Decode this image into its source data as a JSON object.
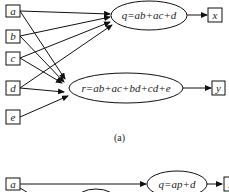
{
  "diagram_a": {
    "inputs": [
      {
        "id": "a",
        "label": "a"
      },
      {
        "id": "b",
        "label": "b"
      },
      {
        "id": "c",
        "label": "c"
      },
      {
        "id": "d",
        "label": "d"
      },
      {
        "id": "e",
        "label": "e"
      }
    ],
    "nodes": [
      {
        "id": "q",
        "label": "q=ab+ac+d",
        "output": "x"
      },
      {
        "id": "r",
        "label": "r=ab+ac+bd+cd+e",
        "output": "y"
      }
    ],
    "outputs": [
      {
        "id": "x",
        "label": "x"
      },
      {
        "id": "y",
        "label": "y"
      }
    ],
    "caption": "(a)"
  },
  "diagram_b": {
    "inputs": [
      {
        "id": "a",
        "label": "a"
      }
    ],
    "nodes": [
      {
        "id": "q",
        "label": "q=ap+d",
        "output": "x"
      }
    ],
    "outputs": [
      {
        "id": "x",
        "label": "x"
      }
    ]
  }
}
